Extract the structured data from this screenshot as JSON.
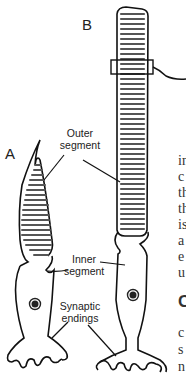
{
  "figure": {
    "panels": [
      {
        "id": "A",
        "label": "A",
        "cell": "cone"
      },
      {
        "id": "B",
        "label": "B",
        "cell": "rod"
      }
    ],
    "callouts": {
      "outer_segment": "Outer\nsegment",
      "outer_segment_line1": "Outer",
      "outer_segment_line2": "segment",
      "inner_segment_line1": "Inner",
      "inner_segment_line2": "segment",
      "synaptic_line1": "Synaptic",
      "synaptic_line2": "endings"
    },
    "colors": {
      "outline": "#111111",
      "disc": "#555555",
      "nucleus": "#222222"
    }
  },
  "body_text": {
    "fragments": [
      "in",
      "c",
      "th",
      "th",
      "is",
      "a",
      "e",
      "u"
    ],
    "heading_fragment": "C",
    "fragments2": [
      "c",
      "s",
      "n"
    ]
  }
}
